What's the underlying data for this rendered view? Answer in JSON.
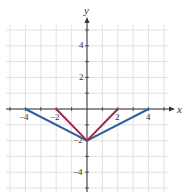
{
  "chart_data": {
    "type": "line",
    "title": "",
    "xlabel": "x",
    "ylabel": "y",
    "xlim": [
      -5,
      5
    ],
    "ylim": [
      -5,
      5.5
    ],
    "grid": true,
    "x_ticks": [
      -4,
      -2,
      2,
      4
    ],
    "y_ticks": [
      4,
      2,
      -2,
      -4
    ],
    "tick_labels": {
      "x": [
        "−4",
        "−2",
        "2",
        "4"
      ],
      "y": [
        "4",
        "2",
        "−2",
        "−4"
      ]
    },
    "series": [
      {
        "name": "y = (1/2)|x| - 2",
        "color": "#2e5f9e",
        "points": [
          [
            -4,
            0
          ],
          [
            0,
            -2
          ],
          [
            4,
            0
          ]
        ]
      },
      {
        "name": "y = |x| - 2",
        "color": "#9e2a4a",
        "points": [
          [
            -2,
            0
          ],
          [
            0,
            -2
          ],
          [
            2,
            0
          ]
        ]
      }
    ],
    "legend": "none"
  }
}
